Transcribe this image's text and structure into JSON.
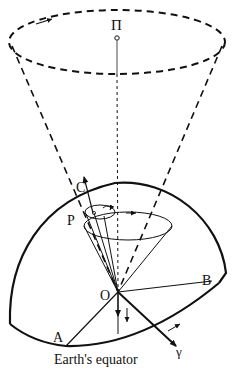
{
  "diagram": {
    "labels": {
      "pole": "Π",
      "celestial_pole": "C",
      "point_p": "P",
      "origin": "O",
      "point_a": "A",
      "point_b": "B",
      "vernal_equinox": "γ",
      "caption": "Earth's equator"
    },
    "colors": {
      "line": "#111111",
      "background": "#ffffff"
    }
  }
}
